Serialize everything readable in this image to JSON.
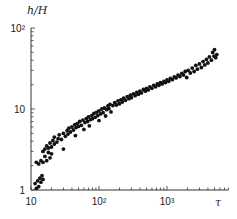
{
  "chart_data": {
    "type": "scatter",
    "title": "",
    "xlabel": "τ",
    "ylabel": "h/H",
    "xscale": "log",
    "yscale": "log",
    "xlim": [
      10,
      8000
    ],
    "ylim": [
      1,
      100
    ],
    "x_ticks": [
      {
        "value": 10,
        "label": "10"
      },
      {
        "value": 100,
        "label": "10²"
      },
      {
        "value": 1000,
        "label": "10³"
      }
    ],
    "y_ticks": [
      {
        "value": 1,
        "label": "1"
      },
      {
        "value": 10,
        "label": "10"
      },
      {
        "value": 100,
        "label": "10²"
      }
    ],
    "grid": false,
    "legend": null,
    "series": [
      {
        "name": "data",
        "color": "#111111",
        "points": [
          [
            11.5,
            1.2
          ],
          [
            12,
            1.05
          ],
          [
            12.5,
            1.3
          ],
          [
            13,
            1.1
          ],
          [
            13.5,
            1.4
          ],
          [
            14,
            1.25
          ],
          [
            14.5,
            1.5
          ],
          [
            15,
            1.35
          ],
          [
            12,
            2.2
          ],
          [
            13,
            2.1
          ],
          [
            14,
            2.3
          ],
          [
            15,
            2.2
          ],
          [
            16,
            2.6
          ],
          [
            17,
            2.3
          ],
          [
            18,
            2.9
          ],
          [
            19,
            2.5
          ],
          [
            15,
            3.0
          ],
          [
            16,
            3.2
          ],
          [
            17,
            3.5
          ],
          [
            18,
            3.3
          ],
          [
            19,
            3.8
          ],
          [
            20,
            3.4
          ],
          [
            21,
            4.1
          ],
          [
            22,
            3.7
          ],
          [
            20,
            2.8
          ],
          [
            22,
            4.5
          ],
          [
            24,
            3.9
          ],
          [
            25,
            4.3
          ],
          [
            26,
            4.8
          ],
          [
            28,
            4.2
          ],
          [
            30,
            5.0
          ],
          [
            30,
            3.2
          ],
          [
            32,
            4.6
          ],
          [
            34,
            5.4
          ],
          [
            35,
            4.9
          ],
          [
            36,
            5.8
          ],
          [
            38,
            5.2
          ],
          [
            40,
            6.0
          ],
          [
            42,
            5.5
          ],
          [
            44,
            6.4
          ],
          [
            45,
            4.7
          ],
          [
            46,
            5.9
          ],
          [
            48,
            6.6
          ],
          [
            50,
            6.1
          ],
          [
            52,
            7.0
          ],
          [
            55,
            6.3
          ],
          [
            58,
            7.3
          ],
          [
            60,
            5.6
          ],
          [
            62,
            6.8
          ],
          [
            65,
            7.6
          ],
          [
            68,
            7.0
          ],
          [
            70,
            8.0
          ],
          [
            72,
            6.2
          ],
          [
            75,
            7.4
          ],
          [
            78,
            8.3
          ],
          [
            80,
            7.6
          ],
          [
            84,
            8.8
          ],
          [
            88,
            7.9
          ],
          [
            92,
            9.1
          ],
          [
            96,
            8.3
          ],
          [
            100,
            9.5
          ],
          [
            100,
            7.2
          ],
          [
            105,
            8.7
          ],
          [
            110,
            10.0
          ],
          [
            115,
            9.0
          ],
          [
            120,
            10.3
          ],
          [
            125,
            8.2
          ],
          [
            130,
            9.8
          ],
          [
            135,
            10.9
          ],
          [
            140,
            10.1
          ],
          [
            145,
            11.4
          ],
          [
            150,
            9.2
          ],
          [
            160,
            11.0
          ],
          [
            170,
            12.0
          ],
          [
            180,
            11.2
          ],
          [
            190,
            12.6
          ],
          [
            200,
            11.6
          ],
          [
            210,
            13.0
          ],
          [
            220,
            12.2
          ],
          [
            230,
            13.6
          ],
          [
            245,
            12.8
          ],
          [
            260,
            14.2
          ],
          [
            275,
            13.4
          ],
          [
            290,
            14.8
          ],
          [
            300,
            13.8
          ],
          [
            320,
            15.4
          ],
          [
            340,
            14.6
          ],
          [
            360,
            16.0
          ],
          [
            380,
            15.2
          ],
          [
            400,
            16.6
          ],
          [
            420,
            15.8
          ],
          [
            450,
            17.4
          ],
          [
            480,
            16.6
          ],
          [
            500,
            18.0
          ],
          [
            530,
            17.2
          ],
          [
            560,
            18.8
          ],
          [
            600,
            18.0
          ],
          [
            640,
            19.6
          ],
          [
            680,
            18.8
          ],
          [
            720,
            20.4
          ],
          [
            760,
            19.6
          ],
          [
            800,
            21.2
          ],
          [
            850,
            20.4
          ],
          [
            900,
            22.0
          ],
          [
            950,
            21.2
          ],
          [
            1000,
            22.8
          ],
          [
            1060,
            22.0
          ],
          [
            1120,
            23.8
          ],
          [
            1200,
            23.0
          ],
          [
            1280,
            25.0
          ],
          [
            1360,
            24.2
          ],
          [
            1450,
            26.2
          ],
          [
            1550,
            25.2
          ],
          [
            1650,
            27.6
          ],
          [
            1750,
            26.4
          ],
          [
            1850,
            29.0
          ],
          [
            1950,
            24.5
          ],
          [
            2050,
            30.0
          ],
          [
            2200,
            27.8
          ],
          [
            2350,
            32.0
          ],
          [
            2500,
            29.0
          ],
          [
            2650,
            34.5
          ],
          [
            2800,
            31.0
          ],
          [
            3000,
            36.0
          ],
          [
            3200,
            32.5
          ],
          [
            3400,
            38.5
          ],
          [
            3600,
            35.0
          ],
          [
            3800,
            41.0
          ],
          [
            4000,
            37.0
          ],
          [
            4200,
            44.0
          ],
          [
            4500,
            40.0
          ],
          [
            4700,
            50.0
          ],
          [
            4900,
            45.0
          ],
          [
            5000,
            54.0
          ],
          [
            5200,
            43.0
          ],
          [
            5400,
            47.0
          ]
        ]
      }
    ]
  }
}
